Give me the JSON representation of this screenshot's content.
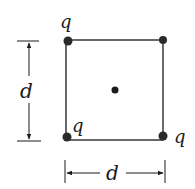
{
  "figure": {
    "charges": [
      {
        "corner": "top-left",
        "label": "q"
      },
      {
        "corner": "top-right",
        "label": ""
      },
      {
        "corner": "bottom-left",
        "label": "q"
      },
      {
        "corner": "bottom-right",
        "label": "q"
      }
    ],
    "center_point": {
      "label": ""
    },
    "dimensions": {
      "vertical_label": "d",
      "horizontal_label": "d"
    },
    "colors": {
      "ink": "#1a1a1a",
      "dot": "#2a2a2a"
    }
  }
}
